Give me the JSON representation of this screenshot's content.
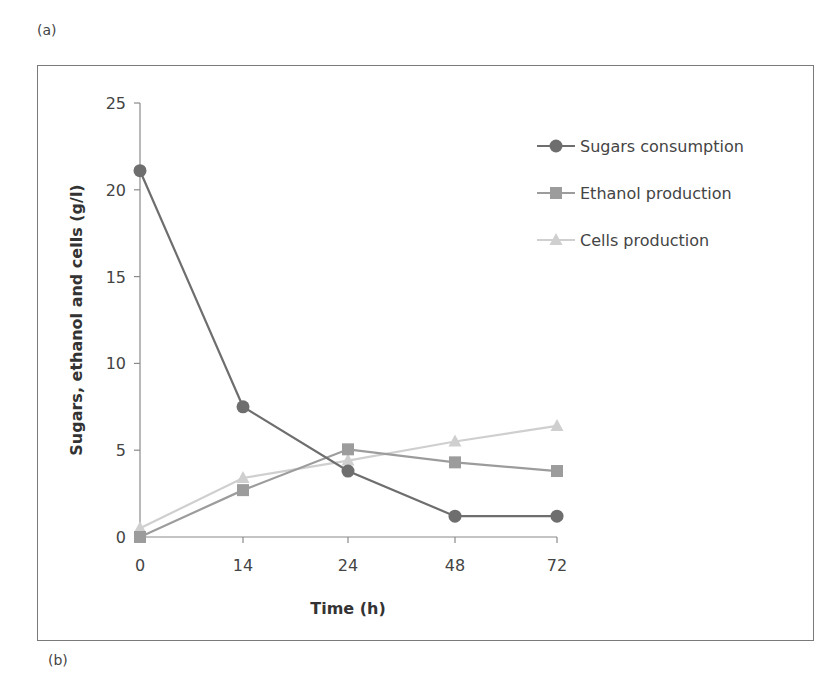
{
  "panels": {
    "top_label": "(a)",
    "bottom_label": "(b)"
  },
  "chart_data": {
    "type": "line",
    "title": "",
    "xlabel": "Time (h)",
    "ylabel": "Sugars, ethanol and cells (g/l)",
    "categories": [
      "0",
      "14",
      "24",
      "48",
      "72"
    ],
    "ylim": [
      0,
      25
    ],
    "yticks": [
      0,
      5,
      10,
      15,
      20,
      25
    ],
    "grid": false,
    "legend_position": "top-right",
    "series": [
      {
        "name": "Sugars consumption",
        "marker": "circle",
        "color": "#6e6e6e",
        "values": [
          21.1,
          7.5,
          3.8,
          1.2,
          1.2
        ]
      },
      {
        "name": "Ethanol production",
        "marker": "square",
        "color": "#9c9c9c",
        "values": [
          0.0,
          2.7,
          5.05,
          4.3,
          3.8
        ]
      },
      {
        "name": "Cells production",
        "marker": "triangle",
        "color": "#cfcfcf",
        "values": [
          0.5,
          3.4,
          4.4,
          5.5,
          6.4
        ]
      }
    ]
  }
}
